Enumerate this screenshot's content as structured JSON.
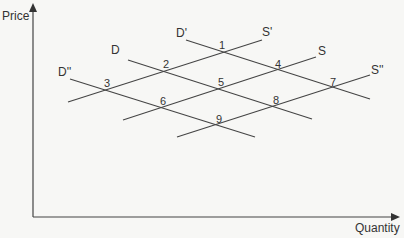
{
  "diagram": {
    "type": "supply-demand",
    "axes": {
      "y_label": "Price",
      "x_label": "Quantity"
    },
    "curves": [
      {
        "id": "D'",
        "label": "D'",
        "kind": "demand",
        "x1": 186,
        "y1": 40,
        "x2": 370,
        "y2": 99
      },
      {
        "id": "D",
        "label": "D",
        "kind": "demand",
        "x1": 128,
        "y1": 60,
        "x2": 312,
        "y2": 119
      },
      {
        "id": "D''",
        "label": "D''",
        "kind": "demand",
        "x1": 70,
        "y1": 79,
        "x2": 255,
        "y2": 137
      },
      {
        "id": "S'",
        "label": "S'",
        "kind": "supply",
        "x1": 68,
        "y1": 102,
        "x2": 262,
        "y2": 40
      },
      {
        "id": "S",
        "label": "S",
        "kind": "supply",
        "x1": 123,
        "y1": 120,
        "x2": 316,
        "y2": 57
      },
      {
        "id": "S''",
        "label": "S''",
        "kind": "supply",
        "x1": 177,
        "y1": 137,
        "x2": 370,
        "y2": 75
      }
    ],
    "intersections": [
      {
        "label": "1",
        "x": 219,
        "y": 40
      },
      {
        "label": "2",
        "x": 163,
        "y": 59
      },
      {
        "label": "3",
        "x": 104,
        "y": 78
      },
      {
        "label": "4",
        "x": 275,
        "y": 59
      },
      {
        "label": "5",
        "x": 218,
        "y": 77
      },
      {
        "label": "6",
        "x": 160,
        "y": 96
      },
      {
        "label": "7",
        "x": 330,
        "y": 77
      },
      {
        "label": "8",
        "x": 273,
        "y": 95
      },
      {
        "label": "9",
        "x": 216,
        "y": 114
      }
    ],
    "curve_labels": [
      {
        "text": "D'",
        "x": 176,
        "y": 27
      },
      {
        "text": "S'",
        "x": 262,
        "y": 26
      },
      {
        "text": "D",
        "x": 111,
        "y": 44
      },
      {
        "text": "S",
        "x": 318,
        "y": 45
      },
      {
        "text": "D''",
        "x": 58,
        "y": 66
      },
      {
        "text": "S''",
        "x": 371,
        "y": 64
      }
    ],
    "line_color": "#444444"
  }
}
